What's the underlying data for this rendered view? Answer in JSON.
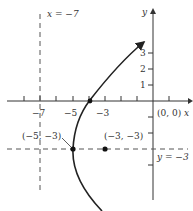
{
  "figure": {
    "type": "parabola-graph",
    "axes": {
      "x_label": "x",
      "y_label": "y",
      "origin_label": "(0, 0)",
      "x_tick_labels": [
        "-7",
        "-5",
        "-3"
      ],
      "y_tick_labels": [
        "1",
        "2",
        "3"
      ]
    },
    "directrix": {
      "label": "x = −7",
      "value": -7
    },
    "axis_of_symmetry": {
      "label": "y = −3",
      "value": -3
    },
    "vertex": {
      "label": "(−5, −3)",
      "x": -5,
      "y": -3
    },
    "focus": {
      "label": "(−3, −3)",
      "x": -3,
      "y": -3
    },
    "colors": {
      "line": "#222222",
      "text": "#333333",
      "dashed": "#555555"
    }
  },
  "labels": {
    "x_eq": "x = −7",
    "y_eq": "y = −3",
    "vertex": "(−5, −3)",
    "focus": "(−3, −3)",
    "origin": "(0, 0)",
    "x_axis": "x",
    "y_axis": "y",
    "tick_m7": "−7",
    "tick_m5": "−5",
    "tick_m3": "−3",
    "tick_1": "1",
    "tick_2": "2",
    "tick_3": "3"
  }
}
